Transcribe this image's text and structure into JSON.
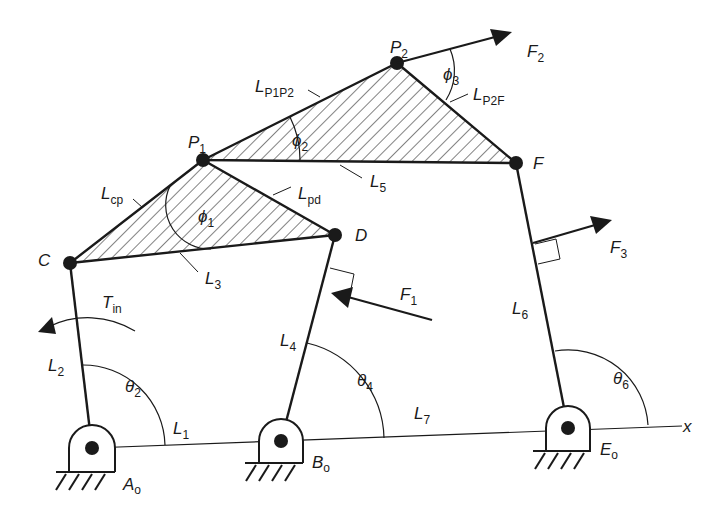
{
  "diagram": {
    "type": "multi-loop planar linkage free-body diagram",
    "colors": {
      "ink": "#1a1a1a",
      "background": "#ffffff"
    },
    "ground_pivots": [
      {
        "id": "Ao",
        "main": "A",
        "sub": "o",
        "x": 92,
        "y": 448
      },
      {
        "id": "Bo",
        "main": "B",
        "sub": "o",
        "x": 281,
        "y": 441
      },
      {
        "id": "Eo",
        "main": "E",
        "sub": "o",
        "x": 568,
        "y": 428
      }
    ],
    "joints": [
      {
        "id": "C",
        "label": "C",
        "x": 70,
        "y": 263
      },
      {
        "id": "P1",
        "main": "P",
        "sub": "1",
        "x": 203,
        "y": 160
      },
      {
        "id": "D",
        "label": "D",
        "x": 335,
        "y": 235
      },
      {
        "id": "P2",
        "main": "P",
        "sub": "2",
        "x": 397,
        "y": 63
      },
      {
        "id": "F",
        "label": "F",
        "x": 516,
        "y": 163
      }
    ],
    "links": {
      "L1": {
        "main": "L",
        "sub": "1"
      },
      "L2": {
        "main": "L",
        "sub": "2"
      },
      "L3": {
        "main": "L",
        "sub": "3"
      },
      "L4": {
        "main": "L",
        "sub": "4"
      },
      "L5": {
        "main": "L",
        "sub": "5"
      },
      "L6": {
        "main": "L",
        "sub": "6"
      },
      "L7": {
        "main": "L",
        "sub": "7"
      },
      "Lcp": {
        "main": "L",
        "sub": "cp"
      },
      "Lpd": {
        "main": "L",
        "sub": "pd"
      },
      "LP1P2": {
        "main": "L",
        "sub": "P1P2"
      },
      "LP2F": {
        "main": "L",
        "sub": "P2F"
      }
    },
    "angles": {
      "theta2": {
        "main": "θ",
        "sub": "2"
      },
      "theta4": {
        "main": "θ",
        "sub": "4"
      },
      "theta6": {
        "main": "θ",
        "sub": "6"
      },
      "phi1": {
        "main": "ϕ",
        "sub": "1"
      },
      "phi2": {
        "main": "ϕ",
        "sub": "2"
      },
      "phi3": {
        "main": "ϕ",
        "sub": "3"
      }
    },
    "forces": {
      "F1": {
        "main": "F",
        "sub": "1"
      },
      "F2": {
        "main": "F",
        "sub": "2"
      },
      "F3": {
        "main": "F",
        "sub": "3"
      }
    },
    "torque": {
      "main": "T",
      "sub": "in"
    },
    "axis_label": "x"
  }
}
